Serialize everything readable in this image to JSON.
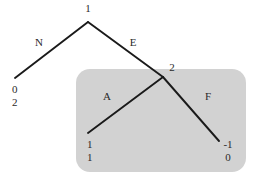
{
  "diagram": {
    "kind": "extensive-form-game-tree",
    "background_color": "#ffffff",
    "line_color": "#1a1a1a",
    "information_set": {
      "name": "information-set-region",
      "fill_color": "#d2d2d2",
      "x": 76,
      "y": 69,
      "width": 170,
      "height": 103,
      "corner_radius": 14
    },
    "nodes": [
      {
        "id": "root",
        "label": "1",
        "x": 88,
        "y": 22,
        "label_x": 88,
        "label_y": 12
      },
      {
        "id": "terminal-left",
        "label": "",
        "x": 15,
        "y": 78,
        "label_x": 0,
        "label_y": 0
      },
      {
        "id": "node-2",
        "label": "2",
        "x": 163,
        "y": 77,
        "label_x": 172,
        "label_y": 71
      },
      {
        "id": "terminal-a",
        "label": "",
        "x": 88,
        "y": 133,
        "label_x": 0,
        "label_y": 0
      },
      {
        "id": "terminal-f",
        "label": "",
        "x": 219,
        "y": 141,
        "label_x": 0,
        "label_y": 0
      }
    ],
    "edges": [
      {
        "id": "edge-N",
        "label": "N",
        "from": "root",
        "to": "terminal-left",
        "x1": 88,
        "y1": 22,
        "x2": 15,
        "y2": 78,
        "label_x": 39,
        "label_y": 46
      },
      {
        "id": "edge-E",
        "label": "E",
        "from": "root",
        "to": "node-2",
        "x1": 88,
        "y1": 22,
        "x2": 163,
        "y2": 77,
        "label_x": 133,
        "label_y": 46
      },
      {
        "id": "edge-A",
        "label": "A",
        "from": "node-2",
        "to": "terminal-a",
        "x1": 163,
        "y1": 77,
        "x2": 88,
        "y2": 133,
        "label_x": 107,
        "label_y": 100
      },
      {
        "id": "edge-F",
        "label": "F",
        "from": "node-2",
        "to": "terminal-f",
        "x1": 163,
        "y1": 77,
        "x2": 219,
        "y2": 141,
        "label_x": 208,
        "label_y": 100
      }
    ],
    "payoffs": [
      {
        "id": "payoff-left",
        "for_node": "terminal-left",
        "top": "0",
        "bottom": "2",
        "x": 12,
        "top_y": 93,
        "bottom_y": 106,
        "align": "start"
      },
      {
        "id": "payoff-a",
        "for_node": "terminal-a",
        "top": "1",
        "bottom": "1",
        "x": 87,
        "top_y": 148,
        "bottom_y": 161,
        "align": "start"
      },
      {
        "id": "payoff-f",
        "for_node": "terminal-f",
        "top": "-1",
        "bottom": "0",
        "x": 228,
        "top_y": 148,
        "bottom_y": 161,
        "align": "middle"
      }
    ]
  }
}
